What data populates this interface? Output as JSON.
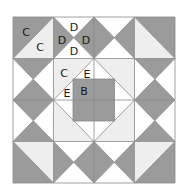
{
  "diagram": {
    "type": "quilt-block",
    "grid": {
      "rows": 4,
      "cols": 4
    },
    "colors": {
      "dark": "#9b9b9b",
      "light": "#eeeeee",
      "white": "#ffffff",
      "line": "#8a8a8a"
    },
    "labels": {
      "c_outer": "C",
      "c_inner": "C",
      "d_top": "D",
      "d_left": "D",
      "d_right": "D",
      "d_bottom": "D",
      "c_center": "C",
      "e_upper": "E",
      "e_lower": "E",
      "b_center": "B"
    },
    "pieces": [
      {
        "label": "B",
        "description": "center dark square"
      },
      {
        "label": "C",
        "description": "half-square triangles (dark/light) and light corner triangles around center diamond"
      },
      {
        "label": "D",
        "description": "quarter-square triangles forming hourglass units"
      },
      {
        "label": "E",
        "description": "white triangles between diamond and center square"
      }
    ]
  }
}
